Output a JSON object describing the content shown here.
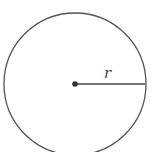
{
  "diagram": {
    "shape": "circle",
    "radius_label": "r",
    "colors": {
      "stroke": "#555555",
      "center_dot": "#333333",
      "background": "#ffffff"
    }
  }
}
